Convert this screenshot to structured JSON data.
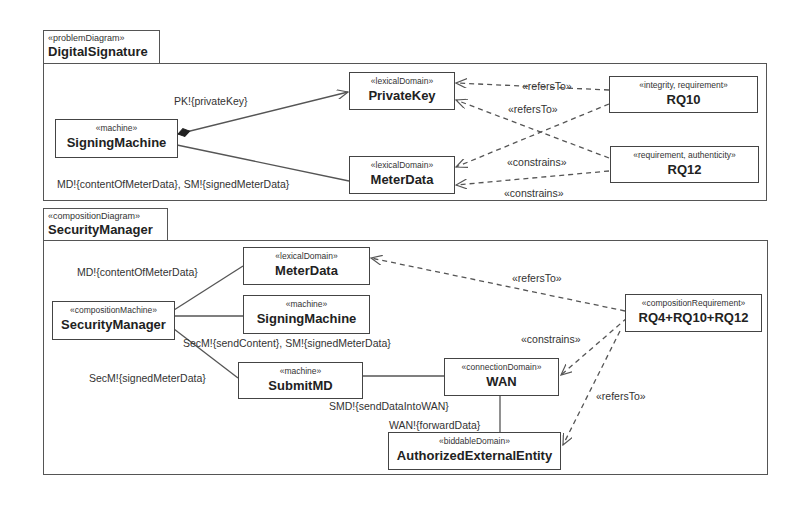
{
  "problem_diagram": {
    "stereotype": "«problemDiagram»",
    "name": "DigitalSignature",
    "nodes": {
      "signing_machine": {
        "stereotype": "«machine»",
        "name": "SigningMachine"
      },
      "private_key": {
        "stereotype": "«lexicalDomain»",
        "name": "PrivateKey"
      },
      "meter_data": {
        "stereotype": "«lexicalDomain»",
        "name": "MeterData"
      },
      "rq10": {
        "stereotype": "«integrity, requirement»",
        "name": "RQ10"
      },
      "rq12": {
        "stereotype": "«requirement, authenticity»",
        "name": "RQ12"
      }
    },
    "labels": {
      "pk": "PK!{privateKey}",
      "md_sm": "MD!{contentOfMeterData}, SM!{signedMeterData}",
      "refers_to_1": "«refersTo»",
      "refers_to_2": "«refersTo»",
      "constrains_1": "«constrains»",
      "constrains_2": "«constrains»"
    }
  },
  "composition_diagram": {
    "stereotype": "«compositionDiagram»",
    "name": "SecurityManager",
    "nodes": {
      "security_manager": {
        "stereotype": "«compositionMachine»",
        "name": "SecurityManager"
      },
      "meter_data": {
        "stereotype": "«lexicalDomain»",
        "name": "MeterData"
      },
      "signing_machine": {
        "stereotype": "«machine»",
        "name": "SigningMachine"
      },
      "submit_md": {
        "stereotype": "«machine»",
        "name": "SubmitMD"
      },
      "wan": {
        "stereotype": "«connectionDomain»",
        "name": "WAN"
      },
      "authorized_external_entity": {
        "stereotype": "«biddableDomain»",
        "name": "AuthorizedExternalEntity"
      },
      "composition_requirement": {
        "stereotype": "«compositionRequirement»",
        "name": "RQ4+RQ10+RQ12"
      }
    },
    "labels": {
      "md_content": "MD!{contentOfMeterData}",
      "secm_send": "SecM!{sendContent}, SM!{signedMeterData}",
      "secm_signed": "SecM!{signedMeterData}",
      "smd_send": "SMD!{sendDataIntoWAN}",
      "wan_forward": "WAN!{forwardData}",
      "refers_to_1": "«refersTo»",
      "constrains": "«constrains»",
      "refers_to_2": "«refersTo»"
    }
  }
}
